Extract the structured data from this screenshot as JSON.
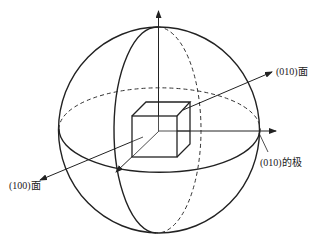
{
  "diagram": {
    "type": "stereographic projection sphere with cubic crystal",
    "stroke_color": "#222222",
    "background": "#ffffff",
    "labels": {
      "face_010": "(010)面",
      "pole_010": "(010)的极",
      "face_100": "(100)面"
    },
    "elements": [
      "reference-sphere",
      "equator-circle",
      "meridian-circle",
      "cubic-crystal",
      "vertical-axis-arrow",
      "normal-010-arrow",
      "pole-010-arrow",
      "normal-100-arrow"
    ]
  }
}
